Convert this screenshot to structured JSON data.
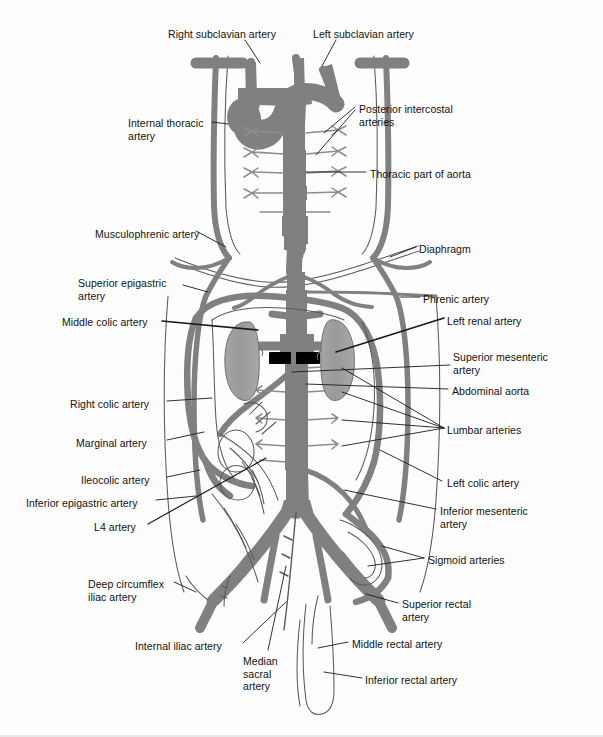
{
  "figure": {
    "colors": {
      "vessel": "#80807e",
      "vessel_outline": "#6f6f6d",
      "organ": "#9d9d9b",
      "marker": "#000000",
      "thin_line": "#4a4a4a",
      "label_text": "#111111",
      "background": "#fdfdfd"
    }
  },
  "labels": {
    "left": [
      {
        "id": "right-subclavian-artery",
        "text": "Right subclavian artery",
        "x": 168,
        "y": 28,
        "align": "left"
      },
      {
        "id": "internal-thoracic-artery",
        "text": "Internal thoracic\nartery",
        "x": 128,
        "y": 117,
        "align": "left"
      },
      {
        "id": "musculophrenic-artery",
        "text": "Musculophrenic artery",
        "x": 95,
        "y": 228,
        "align": "left"
      },
      {
        "id": "superior-epigastric-artery",
        "text": "Superior epigastric\nartery",
        "x": 78,
        "y": 277,
        "align": "left"
      },
      {
        "id": "middle-colic-artery",
        "text": "Middle colic artery",
        "x": 62,
        "y": 316,
        "align": "left"
      },
      {
        "id": "right-colic-artery",
        "text": "Right colic artery",
        "x": 70,
        "y": 398,
        "align": "left"
      },
      {
        "id": "marginal-artery",
        "text": "Marginal artery",
        "x": 76,
        "y": 437,
        "align": "left"
      },
      {
        "id": "ileocolic-artery",
        "text": "Ileocolic artery",
        "x": 81,
        "y": 474,
        "align": "left"
      },
      {
        "id": "inferior-epigastric-artery",
        "text": "Inferior epigastric artery",
        "x": 26,
        "y": 497,
        "align": "left"
      },
      {
        "id": "l4-artery",
        "text": "L4 artery",
        "x": 94,
        "y": 521,
        "align": "left"
      },
      {
        "id": "deep-circumflex-iliac-artery",
        "text": "Deep circumflex\niliac artery",
        "x": 88,
        "y": 578,
        "align": "left"
      },
      {
        "id": "internal-iliac-artery",
        "text": "Internal iliac artery",
        "x": 135,
        "y": 640,
        "align": "left"
      },
      {
        "id": "median-sacral-artery",
        "text": "Median\nsacral\nartery",
        "x": 243,
        "y": 655,
        "align": "left"
      }
    ],
    "right": [
      {
        "id": "left-subclavian-artery",
        "text": "Left subclavian artery",
        "x": 313,
        "y": 28,
        "align": "left"
      },
      {
        "id": "posterior-intercostal-arteries",
        "text": "Posterior intercostal\narteries",
        "x": 359,
        "y": 103,
        "align": "left"
      },
      {
        "id": "thoracic-part-of-aorta",
        "text": "Thoracic part of aorta",
        "x": 370,
        "y": 168,
        "align": "left"
      },
      {
        "id": "diaphragm",
        "text": "Diaphragm",
        "x": 419,
        "y": 243,
        "align": "left"
      },
      {
        "id": "phrenic-artery",
        "text": "Phrenic artery",
        "x": 423,
        "y": 293,
        "align": "left"
      },
      {
        "id": "left-renal-artery",
        "text": "Left renal artery",
        "x": 447,
        "y": 315,
        "align": "left"
      },
      {
        "id": "superior-mesenteric-artery",
        "text": "Superior mesenteric\nartery",
        "x": 453,
        "y": 351,
        "align": "left"
      },
      {
        "id": "abdominal-aorta",
        "text": "Abdominal aorta",
        "x": 452,
        "y": 385,
        "align": "left"
      },
      {
        "id": "lumbar-arteries",
        "text": "Lumbar arteries",
        "x": 447,
        "y": 424,
        "align": "left"
      },
      {
        "id": "left-colic-artery",
        "text": "Left colic artery",
        "x": 447,
        "y": 477,
        "align": "left"
      },
      {
        "id": "inferior-mesenteric-artery",
        "text": "Inferior mesenteric\nartery",
        "x": 440,
        "y": 505,
        "align": "left"
      },
      {
        "id": "sigmoid-arteries",
        "text": "Sigmoid arteries",
        "x": 428,
        "y": 554,
        "align": "left"
      },
      {
        "id": "superior-rectal-artery",
        "text": "Superior rectal\nartery",
        "x": 402,
        "y": 598,
        "align": "left"
      },
      {
        "id": "middle-rectal-artery",
        "text": "Middle rectal artery",
        "x": 352,
        "y": 638,
        "align": "left"
      },
      {
        "id": "inferior-rectal-artery",
        "text": "Inferior rectal artery",
        "x": 365,
        "y": 674,
        "align": "left"
      }
    ]
  }
}
